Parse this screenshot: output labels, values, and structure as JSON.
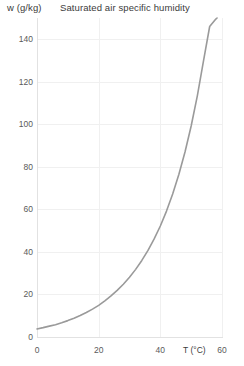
{
  "chart_data": {
    "type": "line",
    "title": "Saturated air specific humidity",
    "xlabel": "T (°C)",
    "ylabel": "w (g/kg)",
    "xlim": [
      0,
      60
    ],
    "ylim": [
      0,
      150
    ],
    "xticks": [
      0,
      20,
      40,
      60
    ],
    "yticks": [
      0,
      20,
      40,
      60,
      80,
      100,
      120,
      140
    ],
    "xtick_labels": [
      "0",
      "20",
      "40",
      "60"
    ],
    "ytick_labels": [
      "0",
      "20",
      "40",
      "60",
      "80",
      "100",
      "120",
      "140"
    ],
    "grid": true,
    "legend": "none",
    "series": [
      {
        "name": "Saturated air specific humidity",
        "color": "#9a9a9a",
        "x": [
          0,
          2,
          4,
          6,
          8,
          10,
          12,
          14,
          16,
          18,
          20,
          22,
          24,
          26,
          28,
          30,
          32,
          34,
          36,
          38,
          40,
          42,
          44,
          46,
          48,
          50,
          52,
          54,
          56,
          58,
          60
        ],
        "values": [
          3.8,
          4.4,
          5.1,
          5.8,
          6.7,
          7.7,
          8.8,
          10.1,
          11.5,
          13.1,
          14.9,
          17.0,
          19.3,
          21.9,
          24.8,
          28.1,
          31.8,
          36.0,
          40.7,
          46.1,
          52.2,
          59.2,
          67.2,
          76.4,
          87.0,
          99.2,
          113.4,
          129.8,
          146.0,
          149.5,
          152.0
        ]
      }
    ]
  },
  "axis": {
    "y_label": "w (g/kg)",
    "x_label": "T (°C)",
    "title": "Saturated air specific humidity"
  },
  "colors": {
    "curve": "#9a9a9a",
    "grid": "#f0f0f0",
    "axis": "#e2e2e2",
    "tick_text": "#5a5a5a",
    "title_text": "#3b3b3b"
  }
}
